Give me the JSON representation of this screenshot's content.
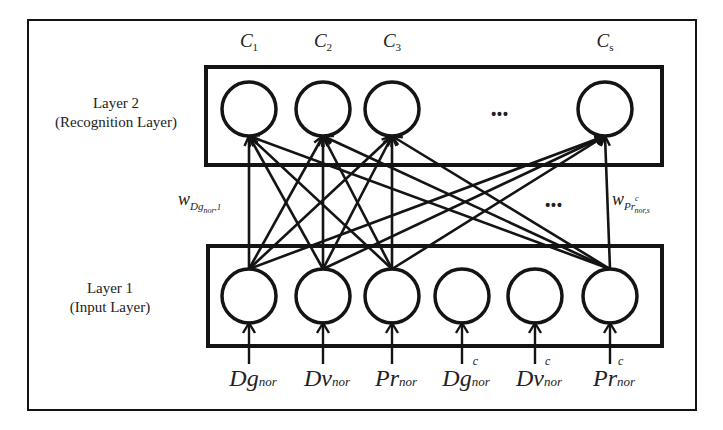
{
  "diagram": {
    "type": "neural-network",
    "colors": {
      "stroke": "#141414",
      "background": "#ffffff",
      "text": "#222222"
    },
    "layer2": {
      "title": "Layer 2",
      "subtitle": "(Recognition Layer)",
      "nodes": [
        {
          "label": "C",
          "sub": "1",
          "x": 249
        },
        {
          "label": "C",
          "sub": "2",
          "x": 323
        },
        {
          "label": "C",
          "sub": "3",
          "x": 392
        },
        {
          "label": "C",
          "sub": "s",
          "x": 605
        }
      ],
      "ellipsis": "•••"
    },
    "layer1": {
      "title": "Layer 1",
      "subtitle": "(Input Layer)",
      "nodes": [
        {
          "label": "Dg",
          "sup": "",
          "sub": "nor",
          "x": 249
        },
        {
          "label": "Dv",
          "sup": "",
          "sub": "nor",
          "x": 323
        },
        {
          "label": "Pr",
          "sup": "",
          "sub": "nor",
          "x": 392
        },
        {
          "label": "Dg",
          "sup": "c",
          "sub": "nor",
          "x": 462
        },
        {
          "label": "Dv",
          "sup": "c",
          "sub": "nor",
          "x": 535
        },
        {
          "label": "Pr",
          "sup": "c",
          "sub": "nor",
          "x": 610
        }
      ]
    },
    "middle_ellipsis": "•••",
    "weights": {
      "left": {
        "w": "w",
        "base": "Dg",
        "sub": "nor",
        "index": ",1"
      },
      "right": {
        "w": "w",
        "base": "Pr",
        "sup": "c",
        "sub": "nor",
        "index": ",s"
      }
    },
    "connections": {
      "from_inputs": [
        0,
        1,
        2,
        5
      ],
      "to_outputs": [
        0,
        1,
        2,
        3
      ]
    }
  }
}
